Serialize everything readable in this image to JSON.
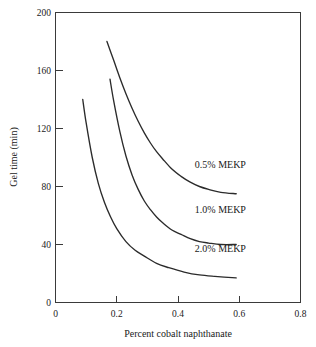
{
  "chart_data": {
    "type": "line",
    "title": "",
    "xlabel": "Percent cobalt naphthanate",
    "ylabel": "Gel time (min)",
    "xlim": [
      0,
      0.8
    ],
    "ylim": [
      0,
      200
    ],
    "grid": false,
    "legend_position": "inline-right",
    "xticks": [
      "0",
      "0.2",
      "0.4",
      "0.6",
      "0.8"
    ],
    "xtick_values": [
      0,
      0.2,
      0.4,
      0.6,
      0.8
    ],
    "yticks": [
      "0",
      "40",
      "80",
      "120",
      "160",
      "200"
    ],
    "ytick_values": [
      0,
      40,
      80,
      120,
      160,
      200
    ],
    "series": [
      {
        "name": "0.5% MEKP",
        "label": "0.5% MEKP",
        "color": "#2b2b2b",
        "x": [
          0.168,
          0.19,
          0.21,
          0.23,
          0.25,
          0.27,
          0.29,
          0.31,
          0.33,
          0.35,
          0.38,
          0.41,
          0.44,
          0.47,
          0.5,
          0.54,
          0.59
        ],
        "y": [
          180,
          167,
          155,
          144,
          134,
          125,
          117,
          110,
          104,
          99,
          92,
          87,
          83,
          80,
          78,
          76,
          75
        ]
      },
      {
        "name": "1.0% MEKP",
        "label": "1.0% MEKP",
        "color": "#2b2b2b",
        "x": [
          0.178,
          0.19,
          0.21,
          0.23,
          0.25,
          0.27,
          0.29,
          0.31,
          0.33,
          0.35,
          0.38,
          0.41,
          0.44,
          0.47,
          0.5,
          0.54,
          0.59
        ],
        "y": [
          154,
          139,
          118,
          101,
          88,
          78,
          70,
          64,
          59,
          55,
          50,
          47,
          44,
          42,
          41,
          40,
          40
        ]
      },
      {
        "name": "2.0% MEKP",
        "label": "2.0% MEKP",
        "color": "#2b2b2b",
        "x": [
          0.089,
          0.1,
          0.12,
          0.14,
          0.16,
          0.18,
          0.2,
          0.23,
          0.26,
          0.29,
          0.33,
          0.37,
          0.42,
          0.47,
          0.52,
          0.59
        ],
        "y": [
          140,
          124,
          100,
          82,
          69,
          59,
          51,
          42,
          36,
          32,
          27,
          24,
          21,
          19,
          18,
          17
        ]
      }
    ],
    "series_label_positions": [
      {
        "label": "0.5% MEKP",
        "x": 0.455,
        "y": 93
      },
      {
        "label": "1.0% MEKP",
        "x": 0.455,
        "y": 62
      },
      {
        "label": "2.0% MEKP",
        "x": 0.455,
        "y": 35
      }
    ],
    "axis_color": "#3a3a3a",
    "background": "#ffffff"
  }
}
